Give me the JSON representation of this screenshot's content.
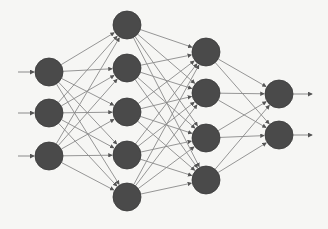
{
  "diagram": {
    "title": "",
    "type": "feedforward-neural-network",
    "colors": {
      "background": "#f6f6f4",
      "node_fill": "#4a4a4a",
      "edge": "#8a8a8a",
      "arrow": "#555555"
    },
    "node_radius": 14,
    "layers": [
      {
        "name": "input",
        "x": 49,
        "nodes_y": [
          72,
          113,
          156
        ]
      },
      {
        "name": "hidden-1",
        "x": 127,
        "nodes_y": [
          25,
          68,
          112,
          155,
          197
        ]
      },
      {
        "name": "hidden-2",
        "x": 206,
        "nodes_y": [
          52,
          93,
          138,
          180
        ]
      },
      {
        "name": "output",
        "x": 279,
        "nodes_y": [
          94,
          135
        ]
      }
    ],
    "input_arrow_start_x": 18,
    "output_arrow_end_x": 312,
    "fully_connected": true
  }
}
